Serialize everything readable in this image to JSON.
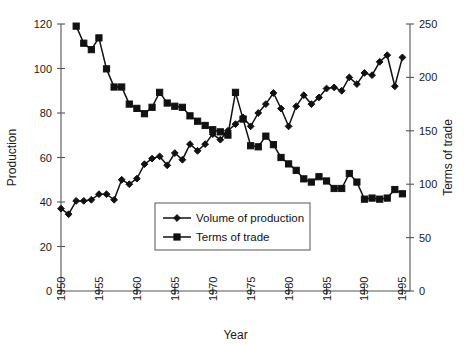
{
  "chart_data": {
    "type": "line",
    "title": "",
    "xlabel": "Year",
    "ylabel": "Production",
    "y2label": "Terms of trade",
    "xlim": [
      1950,
      1996
    ],
    "ylim": [
      0,
      120
    ],
    "y2lim": [
      0,
      250
    ],
    "xticks": [
      1950,
      1955,
      1960,
      1965,
      1970,
      1975,
      1980,
      1985,
      1990,
      1995
    ],
    "yticks": [
      0,
      20,
      40,
      60,
      80,
      100,
      120
    ],
    "y2ticks": [
      0,
      50,
      100,
      150,
      200,
      250
    ],
    "grid": false,
    "legend_position": "center",
    "series": [
      {
        "name": "Volume of production",
        "axis": "left",
        "marker": "diamond",
        "x": [
          1950,
          1951,
          1952,
          1953,
          1954,
          1955,
          1956,
          1957,
          1958,
          1959,
          1960,
          1961,
          1962,
          1963,
          1964,
          1965,
          1966,
          1967,
          1968,
          1969,
          1970,
          1971,
          1972,
          1973,
          1974,
          1975,
          1976,
          1977,
          1978,
          1979,
          1980,
          1981,
          1982,
          1983,
          1984,
          1985,
          1986,
          1987,
          1988,
          1989,
          1990,
          1991,
          1992,
          1993,
          1994,
          1995
        ],
        "values": [
          37,
          34.5,
          40.5,
          40.5,
          41,
          43.5,
          43.5,
          41,
          50,
          48,
          50.5,
          57,
          59.5,
          60.5,
          56.5,
          62,
          59,
          66,
          63,
          66,
          70.5,
          68,
          72,
          75,
          78,
          74,
          80,
          84,
          89,
          82,
          74,
          83,
          88,
          84,
          87,
          91,
          91.5,
          90,
          96,
          93,
          98,
          97,
          103,
          106,
          92,
          105
        ]
      },
      {
        "name": "Terms of trade",
        "axis": "right",
        "marker": "square",
        "x": [
          1952,
          1953,
          1954,
          1955,
          1956,
          1957,
          1958,
          1959,
          1960,
          1961,
          1962,
          1963,
          1964,
          1965,
          1966,
          1967,
          1968,
          1969,
          1970,
          1971,
          1972,
          1973,
          1974,
          1975,
          1976,
          1977,
          1978,
          1979,
          1980,
          1981,
          1982,
          1983,
          1984,
          1985,
          1986,
          1987,
          1988,
          1989,
          1990,
          1991,
          1992,
          1993,
          1994,
          1995
        ],
        "values": [
          248,
          232,
          226,
          237,
          208,
          191,
          191,
          175,
          171,
          166,
          172,
          186,
          176,
          173,
          172,
          164,
          159,
          155,
          151,
          149,
          146,
          186,
          161,
          136,
          135,
          145,
          137,
          125,
          119,
          113,
          105,
          102,
          107,
          103,
          96,
          96,
          110,
          102,
          86,
          87,
          86,
          87,
          95,
          91
        ]
      }
    ]
  },
  "legend": {
    "items": [
      {
        "label": "Volume of production",
        "marker": "diamond"
      },
      {
        "label": "Terms of trade",
        "marker": "square"
      }
    ]
  },
  "colors": {
    "line": "#111111",
    "axis": "#555555",
    "background": "#ffffff"
  }
}
